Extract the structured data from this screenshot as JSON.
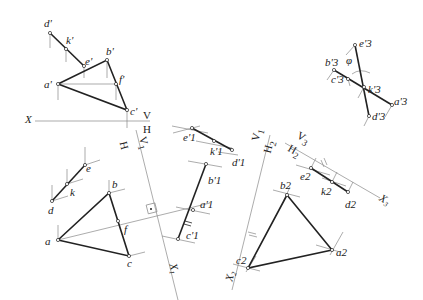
{
  "diagram": {
    "type": "descriptive-geometry-auxiliary-projection",
    "colors": {
      "line": "#222222",
      "thin": "#888888",
      "background": "#ffffff"
    },
    "axes": [
      {
        "id": "X",
        "upper": "V",
        "lower": "H",
        "label": "X"
      },
      {
        "id": "X1",
        "upper": "H",
        "lower": "V1",
        "label": "X1"
      },
      {
        "id": "X2",
        "upper": "V1",
        "lower": "H2",
        "label": "X2"
      },
      {
        "id": "X3",
        "upper": "V3",
        "lower": "H2",
        "label": "X3"
      }
    ],
    "labels": {
      "X": "X",
      "V": "V",
      "H": "H",
      "ax1_H": "H",
      "ax1_V": "V",
      "ax1_V_sub": "1",
      "X1": "X",
      "X1_sub": "1",
      "ax2_V": "V",
      "ax2_V_sub": "1",
      "ax2_H": "H",
      "ax2_H_sub": "2",
      "X2": "X",
      "X2_sub": "2",
      "ax3_V": "V",
      "ax3_V_sub": "3",
      "ax3_H": "H",
      "ax3_H_sub": "2",
      "X3": "X",
      "X3_sub": "3",
      "angle": "φ"
    },
    "points": {
      "v_proj": [
        {
          "name": "d'",
          "x": 50,
          "y": 33
        },
        {
          "name": "k'",
          "x": 66,
          "y": 49
        },
        {
          "name": "e'",
          "x": 84,
          "y": 66
        },
        {
          "name": "b'",
          "x": 107,
          "y": 60
        },
        {
          "name": "a'",
          "x": 58,
          "y": 84
        },
        {
          "name": "f'",
          "x": 116,
          "y": 84
        },
        {
          "name": "c'",
          "x": 127,
          "y": 110
        }
      ],
      "h_proj": [
        {
          "name": "d",
          "x": 52,
          "y": 201
        },
        {
          "name": "k",
          "x": 67,
          "y": 184
        },
        {
          "name": "e",
          "x": 85,
          "y": 165
        },
        {
          "name": "b",
          "x": 109,
          "y": 193
        },
        {
          "name": "a",
          "x": 58,
          "y": 240
        },
        {
          "name": "f",
          "x": 118,
          "y": 221
        },
        {
          "name": "c",
          "x": 129,
          "y": 256
        }
      ],
      "v1_proj": [
        {
          "name": "e'1",
          "x": 192,
          "y": 128
        },
        {
          "name": "k'1",
          "x": 214,
          "y": 141
        },
        {
          "name": "d'1",
          "x": 232,
          "y": 150
        },
        {
          "name": "b'1",
          "x": 206,
          "y": 164
        },
        {
          "name": "a'1",
          "x": 193,
          "y": 210
        },
        {
          "name": "c'1",
          "x": 178,
          "y": 239
        }
      ],
      "h2_proj": [
        {
          "name": "b2",
          "x": 287,
          "y": 195
        },
        {
          "name": "a2",
          "x": 332,
          "y": 250
        },
        {
          "name": "c2",
          "x": 248,
          "y": 268
        },
        {
          "name": "e2",
          "x": 311,
          "y": 168
        },
        {
          "name": "k2",
          "x": 332,
          "y": 182
        },
        {
          "name": "d2",
          "x": 348,
          "y": 192
        }
      ],
      "v3_proj": [
        {
          "name": "e'3",
          "x": 355,
          "y": 45
        },
        {
          "name": "b'3",
          "x": 334,
          "y": 70
        },
        {
          "name": "c'3",
          "x": 348,
          "y": 79
        },
        {
          "name": "k'3",
          "x": 364,
          "y": 87
        },
        {
          "name": "a'3",
          "x": 392,
          "y": 105
        },
        {
          "name": "d'3",
          "x": 369,
          "y": 116
        }
      ]
    }
  }
}
